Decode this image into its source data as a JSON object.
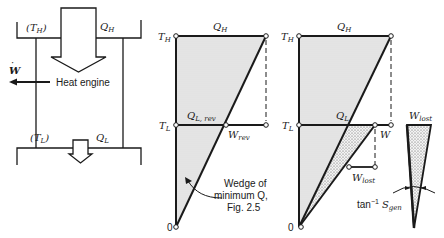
{
  "heat_engine": {
    "hot_reservoir_label": "(T",
    "hot_reservoir_sub": "H",
    "heat_in_label": "Q",
    "heat_in_sub": "H",
    "work_label": "W",
    "work_dot": "·",
    "engine_label": "Heat engine",
    "cold_reservoir_label": "(T",
    "cold_reservoir_sub": "L",
    "heat_out_label": "Q",
    "heat_out_sub": "L",
    "paren_close": ")"
  },
  "reversible_diagram": {
    "th_label": "T",
    "th_sub": "H",
    "qh_label": "Q",
    "qh_sub": "H",
    "tl_label": "T",
    "tl_sub": "L",
    "ql_label": "Q",
    "ql_sub": "L, rev",
    "w_label": "W",
    "w_sub": "rev",
    "origin_label": "0",
    "annotation_lines": [
      "Wedge of",
      "minimum Q,",
      "Fig. 2.5"
    ]
  },
  "irreversible_diagram": {
    "th_label": "T",
    "th_sub": "H",
    "qh_label": "Q",
    "qh_sub": "H",
    "tl_label": "T",
    "tl_sub": "L",
    "ql_label": "Q",
    "ql_sub": "L",
    "w_label": "W",
    "wlost_label": "W",
    "wlost_sub": "lost",
    "origin_label": "0"
  },
  "lost_work_wedge": {
    "wlost_label": "W",
    "wlost_sub": "lost",
    "angle_prefix": "tan",
    "angle_exp": "−1",
    "angle_label": "S",
    "angle_sub": "gen"
  },
  "colors": {
    "line": "#1a1a1a",
    "fill_light": "#e4e4e4",
    "fill_stipple": "#cfcfcf"
  }
}
